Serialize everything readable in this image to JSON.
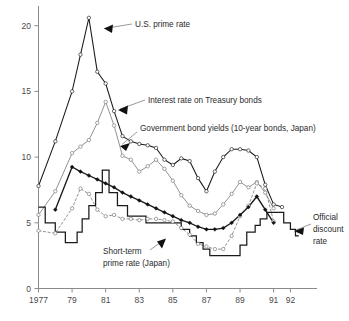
{
  "chart_data": {
    "type": "line",
    "title": "",
    "xlabel": "",
    "ylabel": "",
    "xlim": [
      1977,
      1992.6
    ],
    "ylim": [
      0,
      21.5
    ],
    "grid": false,
    "legend_position": "inline-annotations",
    "x_tick_labels": [
      "1977",
      "79",
      "81",
      "83",
      "85",
      "87",
      "89",
      "91",
      "92"
    ],
    "x_tick_values": [
      1977,
      1979,
      1981,
      1983,
      1985,
      1987,
      1989,
      1991,
      1992
    ],
    "y_tick_labels": [
      "0",
      "5",
      "10",
      "15",
      "20"
    ],
    "y_tick_values": [
      0,
      5,
      10,
      15,
      20
    ],
    "series": [
      {
        "name": "U.S. prime rate",
        "marker": "open-circle-dark",
        "style": "solid-dark",
        "x": [
          1977,
          1978,
          1979,
          1979.5,
          1980,
          1980.5,
          1981,
          1981.5,
          1982,
          1982.5,
          1983,
          1983.5,
          1984,
          1984.5,
          1985,
          1985.5,
          1986,
          1986.5,
          1987,
          1987.5,
          1988,
          1988.5,
          1989,
          1989.5,
          1990,
          1990.5,
          1991,
          1991.5
        ],
        "values": [
          7.8,
          11.2,
          15.0,
          17.8,
          20.6,
          16.5,
          15.6,
          13.5,
          11.6,
          11.2,
          11.0,
          10.9,
          10.7,
          9.8,
          9.4,
          9.9,
          9.7,
          8.4,
          7.4,
          8.9,
          10.0,
          10.6,
          10.6,
          10.5,
          10.0,
          7.9,
          6.4,
          6.2
        ]
      },
      {
        "name": "Interest rate on Treasury bonds",
        "marker": "open-circle",
        "style": "solid-gray",
        "x": [
          1977,
          1978,
          1979,
          1979.5,
          1980,
          1980.5,
          1981,
          1981.5,
          1982,
          1982.5,
          1983,
          1983.5,
          1984,
          1984.5,
          1985,
          1985.5,
          1986,
          1986.5,
          1987,
          1987.5,
          1988,
          1988.5,
          1989,
          1989.5,
          1990,
          1990.5,
          1991
        ],
        "values": [
          5.6,
          7.4,
          10.3,
          10.8,
          11.3,
          12.6,
          14.2,
          12.4,
          10.1,
          9.8,
          8.9,
          9.3,
          9.8,
          9.1,
          8.2,
          7.1,
          6.3,
          5.9,
          5.6,
          5.7,
          6.4,
          7.2,
          8.1,
          7.7,
          8.1,
          7.3,
          6.1
        ]
      },
      {
        "name": "Government bond yields (10-year bonds, Japan)",
        "marker": "open-circle",
        "style": "dashed-gray",
        "x": [
          1977,
          1978,
          1979,
          1979.5,
          1980,
          1980.5,
          1981,
          1981.5,
          1982,
          1982.5,
          1983,
          1983.5,
          1984,
          1984.5,
          1985,
          1985.5,
          1986,
          1986.5,
          1987,
          1987.5,
          1988,
          1988.5,
          1989,
          1989.5,
          1990,
          1990.5,
          1991
        ],
        "values": [
          4.4,
          4.2,
          6.1,
          7.6,
          7.2,
          6.0,
          5.5,
          5.6,
          5.3,
          5.3,
          5.2,
          5.3,
          5.3,
          5.2,
          5.1,
          4.6,
          4.1,
          3.4,
          3.2,
          3.0,
          3.0,
          4.0,
          5.5,
          6.3,
          8.0,
          7.6,
          5.1
        ]
      },
      {
        "name": "Short-term prime rate (Japan)",
        "marker": "solid-diamond",
        "style": "solid-dark-thick",
        "x": [
          1978,
          1979,
          1979.5,
          1980,
          1980.5,
          1981,
          1981.5,
          1982,
          1982.5,
          1983,
          1983.5,
          1984,
          1984.5,
          1985,
          1985.5,
          1986,
          1986.5,
          1987,
          1987.5,
          1988,
          1988.5,
          1989,
          1989.5,
          1990,
          1990.5,
          1991
        ],
        "values": [
          6.0,
          9.25,
          8.9,
          8.6,
          8.3,
          8.0,
          7.7,
          7.3,
          7.0,
          6.7,
          6.4,
          6.1,
          5.8,
          5.5,
          5.2,
          5.0,
          4.7,
          4.5,
          4.5,
          4.6,
          5.0,
          5.6,
          6.2,
          7.0,
          6.0,
          5.0
        ]
      },
      {
        "name": "Official discount rate",
        "marker": "none",
        "style": "step-dark",
        "x": [
          1977,
          1977.4,
          1977.4,
          1978.0,
          1978.0,
          1978.6,
          1978.6,
          1979.3,
          1979.3,
          1979.6,
          1979.6,
          1980.0,
          1980.0,
          1980.4,
          1980.4,
          1980.8,
          1980.8,
          1981.2,
          1981.2,
          1981.7,
          1981.7,
          1982.3,
          1982.3,
          1983.4,
          1983.4,
          1984.8,
          1984.8,
          1985.5,
          1985.5,
          1986.0,
          1986.0,
          1986.4,
          1986.4,
          1986.8,
          1986.8,
          1987.2,
          1987.2,
          1989.0,
          1989.0,
          1989.4,
          1989.4,
          1989.9,
          1989.9,
          1990.2,
          1990.2,
          1990.6,
          1990.6,
          1991.0,
          1991.0,
          1991.6,
          1991.6,
          1992.0,
          1992.0,
          1992.3,
          1992.3,
          1992.5
        ],
        "values": [
          6.2,
          6.2,
          5.0,
          5.0,
          4.3,
          4.3,
          3.5,
          3.5,
          4.3,
          4.3,
          5.3,
          5.3,
          6.3,
          6.3,
          7.3,
          7.3,
          9.0,
          9.0,
          7.3,
          7.3,
          6.3,
          6.3,
          5.5,
          5.5,
          5.0,
          5.0,
          5.0,
          5.0,
          4.5,
          4.5,
          4.0,
          4.0,
          3.5,
          3.5,
          3.0,
          3.0,
          2.5,
          2.5,
          3.3,
          3.3,
          4.3,
          4.3,
          4.8,
          4.8,
          5.3,
          5.3,
          5.8,
          5.8,
          5.8,
          5.8,
          5.0,
          5.0,
          4.5,
          4.5,
          4.0,
          4.0
        ]
      }
    ],
    "annotations": [
      {
        "id": "us-prime-rate",
        "lines": [
          "U.S. prime rate"
        ]
      },
      {
        "id": "treasury-bonds",
        "lines": [
          "Interest rate on Treasury bonds"
        ]
      },
      {
        "id": "japan-gov-bond-yields",
        "lines": [
          "Government bond yields (10-year bonds, Japan)"
        ]
      },
      {
        "id": "short-term-prime-rate",
        "lines": [
          "Short-term",
          "prime rate (Japan)"
        ]
      },
      {
        "id": "official-discount-rate",
        "lines": [
          "Official",
          "discount",
          "rate"
        ]
      }
    ]
  }
}
